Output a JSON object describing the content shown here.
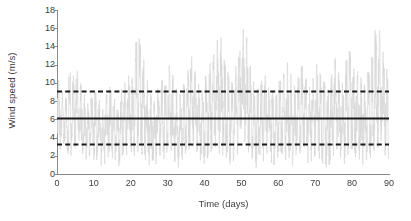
{
  "chart_data": {
    "type": "line",
    "title": "",
    "subtitle": "",
    "xlabel": "Time (days)",
    "ylabel": "Wind speed (m/s)",
    "xlim": [
      0,
      90
    ],
    "ylim": [
      0,
      18
    ],
    "xticks": [
      0,
      10,
      20,
      30,
      40,
      50,
      60,
      70,
      80,
      90
    ],
    "yticks": [
      0,
      2,
      4,
      6,
      8,
      10,
      12,
      14,
      16,
      18
    ],
    "grid": false,
    "legend_position": "none",
    "annotations": [],
    "colors": {
      "series_wind_speed": "#d9d9d9",
      "mean_line": "#1a1a1a",
      "bound_line": "#1a1a1a",
      "axis": "#8a8a8a",
      "text": "#3c3c3c",
      "background": "#ffffff"
    },
    "series": [
      {
        "name": "Wind speed time series",
        "style": "solid-thin",
        "color": "#d9d9d9",
        "sampling_interval_days": 0.0417,
        "x_range_days": [
          0,
          90
        ],
        "value_range": [
          0.3,
          16.3
        ],
        "mean": 6.2,
        "description": "High-frequency noisy wind speed record, hourly resolution over 90 days",
        "daily_max": [
          10.4,
          9.2,
          8.6,
          11.2,
          10.9,
          11.4,
          10.1,
          9.3,
          7.8,
          8.4,
          9.1,
          8.2,
          7.4,
          8.9,
          9.6,
          8.3,
          7.1,
          9.4,
          10.2,
          11.1,
          10.6,
          14.5,
          15.0,
          12.8,
          10.3,
          9.1,
          8.4,
          9.7,
          10.5,
          9.9,
          12.2,
          11.0,
          9.6,
          8.8,
          10.1,
          11.6,
          12.9,
          11.4,
          10.0,
          9.2,
          10.8,
          12.6,
          13.4,
          14.8,
          15.2,
          13.1,
          11.3,
          10.4,
          12.0,
          14.6,
          16.3,
          15.4,
          12.1,
          10.2,
          9.4,
          10.6,
          11.8,
          10.3,
          9.1,
          8.7,
          10.4,
          11.2,
          12.4,
          11.0,
          9.8,
          10.7,
          11.9,
          10.5,
          9.6,
          10.8,
          12.3,
          11.1,
          10.2,
          9.4,
          11.6,
          12.8,
          11.3,
          10.1,
          12.5,
          13.6,
          12.2,
          11.4,
          10.6,
          9.8,
          11.2,
          13.0,
          15.8,
          16.1,
          14.2,
          11.5
        ],
        "daily_min": [
          2.6,
          3.1,
          2.4,
          2.0,
          2.8,
          3.4,
          2.2,
          1.6,
          1.9,
          2.5,
          1.4,
          1.1,
          0.9,
          1.7,
          2.3,
          1.5,
          0.8,
          1.2,
          2.0,
          2.7,
          1.8,
          2.4,
          3.0,
          2.1,
          1.3,
          0.7,
          1.0,
          1.6,
          2.2,
          1.4,
          2.0,
          1.2,
          0.6,
          1.1,
          1.9,
          2.6,
          3.2,
          2.3,
          1.5,
          0.9,
          1.7,
          2.4,
          3.1,
          2.8,
          2.0,
          1.4,
          0.8,
          1.3,
          2.1,
          2.9,
          3.4,
          2.2,
          1.6,
          1.0,
          0.5,
          1.2,
          2.0,
          1.4,
          0.9,
          1.5,
          2.3,
          1.7,
          1.1,
          0.7,
          1.4,
          2.1,
          2.8,
          1.9,
          1.2,
          1.8,
          2.5,
          1.6,
          1.0,
          0.6,
          1.3,
          2.0,
          1.5,
          0.9,
          1.7,
          2.4,
          1.8,
          1.1,
          0.8,
          1.4,
          2.2,
          1.6,
          2.0,
          2.6,
          1.9,
          1.3
        ]
      },
      {
        "name": "Mean wind speed",
        "style": "solid-thick",
        "color": "#1a1a1a",
        "type": "horizontal-line",
        "value": 6.2
      },
      {
        "name": "Upper bound",
        "style": "dashed",
        "color": "#1a1a1a",
        "type": "horizontal-line",
        "value": 9.1
      },
      {
        "name": "Lower bound",
        "style": "dashed",
        "color": "#1a1a1a",
        "type": "horizontal-line",
        "value": 3.3
      }
    ]
  }
}
